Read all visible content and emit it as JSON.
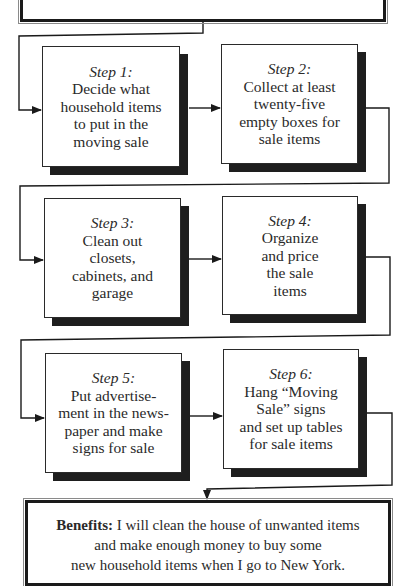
{
  "diagram": {
    "type": "flowchart",
    "top_frame": {
      "text": ""
    },
    "steps": [
      {
        "title": "Step 1:",
        "lines": [
          "Decide what",
          "household items",
          "to put in the",
          "moving sale"
        ]
      },
      {
        "title": "Step 2:",
        "lines": [
          "Collect at least",
          "twenty-five",
          "empty boxes for",
          "sale items"
        ]
      },
      {
        "title": "Step 3:",
        "lines": [
          "Clean out",
          "closets,",
          "cabinets, and",
          "garage"
        ]
      },
      {
        "title": "Step 4:",
        "lines": [
          "Organize",
          "and price",
          "the sale",
          "items"
        ]
      },
      {
        "title": "Step 5:",
        "lines": [
          "Put advertise-",
          "ment in the news-",
          "paper and make",
          "signs for sale"
        ]
      },
      {
        "title": "Step 6:",
        "lines": [
          "Hang “Moving",
          "Sale” signs",
          "and set up tables",
          "for sale items"
        ]
      }
    ],
    "benefits": {
      "label": "Benefits:",
      "line1": " I will clean the house of unwanted items",
      "line2": "and make enough money to buy some",
      "line3": "new household items when I go to New York."
    },
    "colors": {
      "line": "#1a1a1a",
      "shadow": "#1e1e1e",
      "text": "#2a2a2a",
      "background": "#ffffff"
    }
  }
}
